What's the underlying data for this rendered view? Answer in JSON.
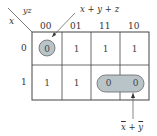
{
  "kmap": {
    "row_var": "x",
    "col_var": "yz",
    "col_headers": [
      "00",
      "01",
      "11",
      "10"
    ],
    "row_headers": [
      "0",
      "1"
    ],
    "cells": [
      [
        "0",
        "1",
        "1",
        "1"
      ],
      [
        "1",
        "1",
        "0",
        "0"
      ]
    ],
    "groups": [
      {
        "label": "x + y + z",
        "cells": [
          [
            0,
            0
          ]
        ]
      },
      {
        "label_vars": [
          "x",
          "y"
        ],
        "label_op": "+",
        "complemented": true,
        "cells": [
          [
            1,
            2
          ],
          [
            1,
            3
          ]
        ]
      }
    ],
    "group_fill": "#b9c4c8",
    "line_color": "#444444"
  }
}
